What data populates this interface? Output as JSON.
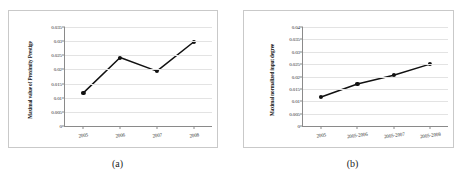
{
  "figure": {
    "panels": [
      {
        "caption": "(a)",
        "chart_data": {
          "type": "line",
          "title": "",
          "xlabel": "",
          "ylabel": "Maximal value of Proximity Prestige",
          "categories": [
            "2005",
            "2006",
            "2007",
            "2008"
          ],
          "values": [
            0.0117,
            0.0242,
            0.0194,
            0.0297
          ],
          "ylim": [
            0,
            0.035
          ],
          "yticks": [
            0,
            0.005,
            0.01,
            0.015,
            0.02,
            0.025,
            0.03,
            0.035
          ],
          "ytick_labels": [
            "0",
            "0.005",
            "0.01",
            "0.015",
            "0.02",
            "0.025",
            "0.03",
            "0.035"
          ],
          "grid": true,
          "legend": false,
          "marker": "filled-circle",
          "line_color": "#111111",
          "marker_color": "#111111"
        }
      },
      {
        "caption": "(b)",
        "chart_data": {
          "type": "line",
          "title": "",
          "xlabel": "",
          "ylabel": "Maximal normalized input degree",
          "categories": [
            "2005",
            "2005-2006",
            "2005-2007",
            "2005-2008"
          ],
          "values": [
            0.0117,
            0.017,
            0.0205,
            0.025
          ],
          "ylim": [
            0,
            0.04
          ],
          "yticks": [
            0,
            0.005,
            0.01,
            0.015,
            0.02,
            0.025,
            0.03,
            0.035,
            0.04
          ],
          "ytick_labels": [
            "0",
            "0.005",
            "0.01",
            "0.015",
            "0.02",
            "0.025",
            "0.03",
            "0.035",
            "0.04"
          ],
          "grid": true,
          "legend": false,
          "marker": "filled-circle",
          "line_color": "#111111",
          "marker_color": "#111111"
        }
      }
    ]
  }
}
